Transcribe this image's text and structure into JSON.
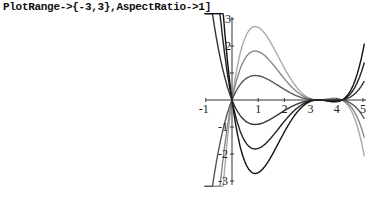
{
  "code_line": "PlotRange->{-3,3},AspectRatio->1]",
  "chart_data": {
    "type": "line",
    "title": "",
    "xlabel": "",
    "ylabel": "",
    "xlim": [
      -1,
      5
    ],
    "ylim": [
      -3,
      3
    ],
    "grid": false,
    "x_ticks": [
      "-1",
      "1",
      "2",
      "3",
      "4",
      "5"
    ],
    "y_ticks": [
      "3",
      "2",
      "1",
      "-1",
      "-2",
      "-3"
    ],
    "series": [
      {
        "name": "k=-3",
        "peak_at_1.4": 2.25,
        "color": "#aaaaaa"
      },
      {
        "name": "k=-2",
        "peak_at_1.4": 1.5,
        "color": "#888888"
      },
      {
        "name": "k=-1",
        "peak_at_1.4": 0.75,
        "color": "#555555"
      },
      {
        "name": "k=1",
        "peak_at_1.4": -0.75,
        "color": "#333333"
      },
      {
        "name": "k=2",
        "peak_at_1.4": -1.5,
        "color": "#222222"
      },
      {
        "name": "k=3",
        "peak_at_1.4": -2.25,
        "color": "#111111"
      }
    ],
    "zeros": [
      0,
      3.3,
      4.2
    ]
  }
}
